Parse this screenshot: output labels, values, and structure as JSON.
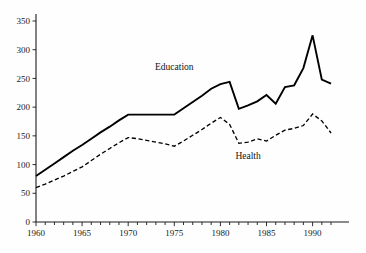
{
  "chart_data": {
    "type": "line",
    "title": "",
    "subtitle": "",
    "xlabel": "",
    "ylabel": "",
    "xlim": [
      1960,
      1993
    ],
    "ylim": [
      0,
      360
    ],
    "grid": false,
    "legend_position": "inline-annotations",
    "x": [
      1960,
      1961,
      1962,
      1963,
      1964,
      1965,
      1966,
      1967,
      1968,
      1969,
      1970,
      1971,
      1972,
      1973,
      1974,
      1975,
      1976,
      1977,
      1978,
      1979,
      1980,
      1981,
      1982,
      1983,
      1984,
      1985,
      1986,
      1987,
      1988,
      1989,
      1990,
      1991,
      1992
    ],
    "x_tick_values": [
      1960,
      1965,
      1970,
      1975,
      1980,
      1985,
      1990
    ],
    "x_tick_labels": [
      "1960",
      "1965",
      "1970",
      "1975",
      "1980",
      "1985",
      "1990"
    ],
    "x_minor_ticks": [
      1961,
      1962,
      1963,
      1964,
      1966,
      1967,
      1968,
      1969,
      1971,
      1972,
      1973,
      1974,
      1976,
      1977,
      1978,
      1979,
      1981,
      1982,
      1983,
      1984,
      1986,
      1987,
      1988,
      1989,
      1991,
      1992
    ],
    "y_tick_values": [
      0,
      50,
      100,
      150,
      200,
      250,
      300,
      350
    ],
    "y_tick_labels": [
      "0",
      "50",
      "100",
      "150",
      "200",
      "250",
      "300",
      "350"
    ],
    "series": [
      {
        "name": "Education",
        "style": "solid",
        "color": "#000000",
        "label_text": "Education",
        "values": [
          80,
          91,
          102,
          113,
          124,
          134,
          145,
          156,
          166,
          177,
          187,
          187,
          187,
          187,
          187,
          187,
          198,
          209,
          220,
          232,
          240,
          244,
          197,
          203,
          210,
          221,
          206,
          235,
          238,
          268,
          325,
          248,
          241
        ]
      },
      {
        "name": "Health",
        "style": "dashed",
        "color": "#000000",
        "label_text": "Health",
        "values": [
          60,
          66,
          73,
          80,
          88,
          96,
          107,
          118,
          128,
          138,
          147,
          145,
          142,
          139,
          136,
          132,
          141,
          151,
          161,
          172,
          182,
          170,
          137,
          139,
          145,
          141,
          151,
          160,
          163,
          168,
          188,
          176,
          155
        ]
      }
    ],
    "annotations": [
      {
        "text": "Education",
        "x": 1975.0,
        "y": 264,
        "name": "education-label"
      },
      {
        "text": "Health",
        "x": 1983.0,
        "y": 110,
        "name": "health-label"
      }
    ]
  }
}
